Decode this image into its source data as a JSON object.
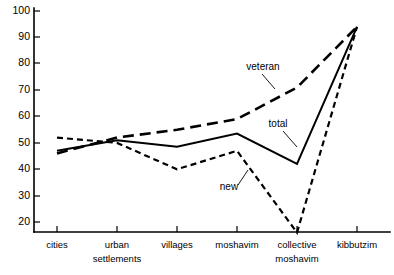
{
  "chart_data": {
    "type": "line",
    "title": "",
    "xlabel": "",
    "ylabel": "",
    "categories": [
      "cities",
      "urban settlements",
      "villages",
      "moshavim",
      "collective moshavim",
      "kibbutzim"
    ],
    "yticks": [
      20,
      30,
      40,
      50,
      60,
      70,
      80,
      90,
      100
    ],
    "ylim": [
      14,
      100
    ],
    "grid": false,
    "legend_position": "inline-annotations",
    "series": [
      {
        "name": "veteran",
        "style": "long-dashed",
        "values": [
          46,
          52,
          55,
          59,
          71,
          94
        ]
      },
      {
        "name": "total",
        "style": "solid",
        "values": [
          47,
          51,
          48.5,
          53.5,
          42,
          94
        ]
      },
      {
        "name": "new",
        "style": "short-dashed",
        "values": [
          52,
          50,
          40,
          47,
          16,
          94
        ]
      }
    ],
    "annotations": [
      {
        "text": "veteran",
        "series": "veteran"
      },
      {
        "text": "total",
        "series": "total"
      },
      {
        "text": "new",
        "series": "new"
      }
    ]
  },
  "axis": {
    "ytick_labels": [
      "100",
      "90",
      "80",
      "70",
      "60",
      "50",
      "40",
      "30",
      "20"
    ],
    "xtick_labels": [
      {
        "line1": "cities",
        "line2": ""
      },
      {
        "line1": "urban",
        "line2": "settlements"
      },
      {
        "line1": "villages",
        "line2": ""
      },
      {
        "line1": "moshavim",
        "line2": ""
      },
      {
        "line1": "collective",
        "line2": "moshavim"
      },
      {
        "line1": "kibbutzim",
        "line2": ""
      }
    ]
  },
  "labels": {
    "veteran": "veteran",
    "total": "total",
    "new": "new"
  },
  "colors": {
    "ink": "#000000",
    "background": "#ffffff"
  }
}
